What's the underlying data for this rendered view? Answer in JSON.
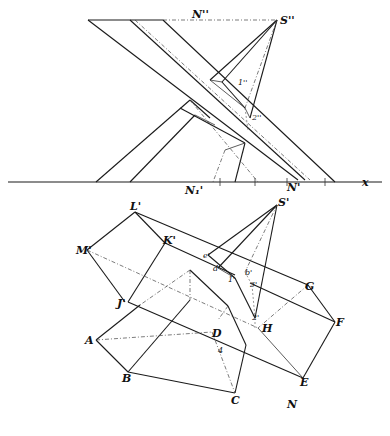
{
  "figure": {
    "type": "descriptive-geometry-projection",
    "upper_view": "elevation",
    "lower_view": "plan",
    "ground_line_label": "x",
    "labels_elevation": {
      "N2": "N''",
      "S2": "S''",
      "p1": "1''",
      "p2": "2''",
      "N1x": "N₁'",
      "Nx": "N'",
      "x": "x"
    },
    "labels_plan": {
      "L": "L'",
      "K": "K'",
      "M": "M'",
      "J": "J'",
      "S1": "S'",
      "e": "e'",
      "d": "d'",
      "one": "1'",
      "b": "b'",
      "three": "3'",
      "two": "2'",
      "G": "G",
      "F": "F",
      "H": "H",
      "D": "D",
      "A": "A",
      "B": "B",
      "C": "C",
      "E": "E",
      "N": "N",
      "four": "4"
    }
  }
}
